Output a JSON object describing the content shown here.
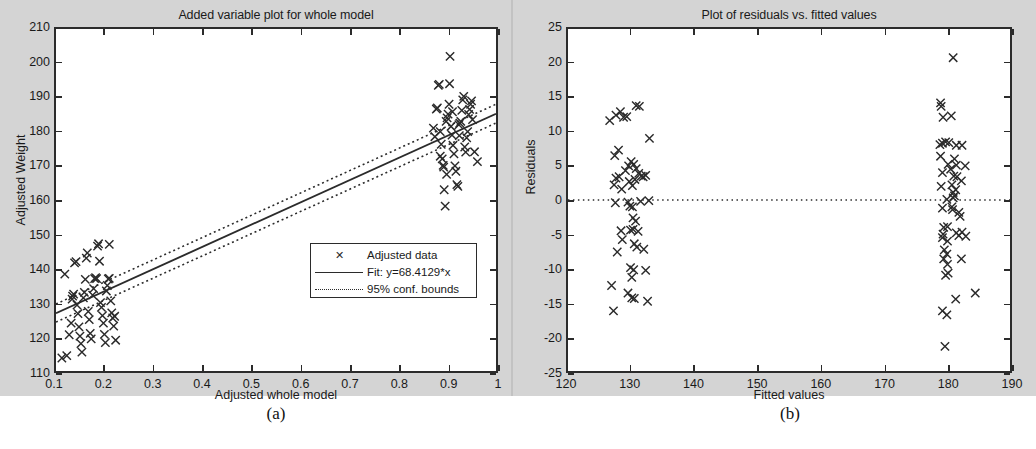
{
  "figure": {
    "background_color": "#d4d4d4",
    "plot_area_color": "#ffffff",
    "axis_color": "#2b2b2b",
    "marker_color": "#2b2b2b",
    "captions": [
      {
        "id": "a",
        "label": "(a)"
      },
      {
        "id": "b",
        "label": "(b)"
      }
    ]
  },
  "chart_data": [
    {
      "type": "scatter",
      "panel": "a",
      "title": "Added variable plot for whole model",
      "xlabel": "Adjusted whole model",
      "ylabel": "Adjusted Weight",
      "xlim": [
        0.1,
        1
      ],
      "ylim": [
        110,
        210
      ],
      "xticks": [
        0.1,
        0.2,
        0.3,
        0.4,
        0.5,
        0.6,
        0.7,
        0.8,
        0.9,
        1
      ],
      "xticklabels": [
        "0.1",
        "0.2",
        "0.3",
        "0.4",
        "0.5",
        "0.6",
        "0.7",
        "0.8",
        "0.9",
        "1"
      ],
      "yticks": [
        110,
        120,
        130,
        140,
        150,
        160,
        170,
        180,
        190,
        200,
        210
      ],
      "yticklabels": [
        "110",
        "120",
        "130",
        "140",
        "150",
        "160",
        "170",
        "180",
        "190",
        "200",
        "210"
      ],
      "grid": false,
      "legend_position": "center-right",
      "legend": [
        {
          "marker": "x",
          "style": "marker",
          "label": "Adjusted data"
        },
        {
          "marker": "line",
          "style": "solid",
          "label": "Fit: y=68.4129*x"
        },
        {
          "marker": "line",
          "style": "dotted",
          "label": "95% conf. bounds"
        }
      ],
      "fit_line": {
        "equation": "y=68.4129*x",
        "slope": 68.4129,
        "x": [
          0.1,
          1.0
        ],
        "y": [
          126.9,
          185.2
        ]
      },
      "conf_bounds": {
        "label": "95% conf. bounds",
        "upper": {
          "x": [
            0.1,
            1.0
          ],
          "y": [
            129.6,
            188.0
          ]
        },
        "lower": {
          "x": [
            0.1,
            1.0
          ],
          "y": [
            124.3,
            182.5
          ]
        }
      },
      "series": [
        {
          "name": "Adjusted data",
          "marker": "x",
          "points": [
            [
              0.118,
              138.3
            ],
            [
              0.112,
              113.8
            ],
            [
              0.122,
              114.5
            ],
            [
              0.127,
              120.6
            ],
            [
              0.131,
              124.0
            ],
            [
              0.133,
              131.0
            ],
            [
              0.134,
              131.9
            ],
            [
              0.136,
              132.5
            ],
            [
              0.138,
              141.6
            ],
            [
              0.141,
              142.0
            ],
            [
              0.143,
              129.3
            ],
            [
              0.145,
              126.8
            ],
            [
              0.147,
              122.9
            ],
            [
              0.149,
              120.2
            ],
            [
              0.151,
              118.0
            ],
            [
              0.153,
              115.5
            ],
            [
              0.156,
              131.4
            ],
            [
              0.158,
              133.0
            ],
            [
              0.16,
              136.8
            ],
            [
              0.162,
              143.0
            ],
            [
              0.164,
              144.5
            ],
            [
              0.166,
              127.4
            ],
            [
              0.168,
              125.0
            ],
            [
              0.17,
              121.0
            ],
            [
              0.172,
              119.4
            ],
            [
              0.175,
              132.2
            ],
            [
              0.177,
              134.1
            ],
            [
              0.179,
              137.0
            ],
            [
              0.181,
              137.3
            ],
            [
              0.183,
              137.0
            ],
            [
              0.185,
              146.5
            ],
            [
              0.187,
              147.2
            ],
            [
              0.189,
              142.1
            ],
            [
              0.191,
              130.0
            ],
            [
              0.193,
              128.6
            ],
            [
              0.195,
              126.2
            ],
            [
              0.197,
              124.0
            ],
            [
              0.199,
              120.7
            ],
            [
              0.201,
              118.3
            ],
            [
              0.203,
              133.4
            ],
            [
              0.205,
              135.0
            ],
            [
              0.207,
              136.9
            ],
            [
              0.209,
              137.1
            ],
            [
              0.212,
              130.5
            ],
            [
              0.214,
              127.0
            ],
            [
              0.216,
              125.5
            ],
            [
              0.218,
              123.1
            ],
            [
              0.22,
              126.0
            ],
            [
              0.222,
              119.0
            ],
            [
              0.209,
              147.0
            ],
            [
              0.872,
              181.0
            ],
            [
              0.875,
              178.5
            ],
            [
              0.878,
              186.6
            ],
            [
              0.88,
              186.9
            ],
            [
              0.882,
              193.5
            ],
            [
              0.884,
              193.8
            ],
            [
              0.886,
              180.0
            ],
            [
              0.888,
              176.3
            ],
            [
              0.89,
              172.0
            ],
            [
              0.892,
              170.1
            ],
            [
              0.894,
              163.0
            ],
            [
              0.896,
              158.2
            ],
            [
              0.898,
              183.0
            ],
            [
              0.9,
              184.0
            ],
            [
              0.902,
              185.1
            ],
            [
              0.904,
              188.0
            ],
            [
              0.905,
              194.0
            ],
            [
              0.906,
              202.0
            ],
            [
              0.908,
              181.5
            ],
            [
              0.91,
              179.0
            ],
            [
              0.912,
              176.0
            ],
            [
              0.914,
              173.5
            ],
            [
              0.916,
              170.0
            ],
            [
              0.918,
              168.4
            ],
            [
              0.92,
              164.5
            ],
            [
              0.922,
              164.0
            ],
            [
              0.924,
              182.0
            ],
            [
              0.926,
              182.5
            ],
            [
              0.928,
              183.0
            ],
            [
              0.93,
              186.2
            ],
            [
              0.932,
              189.3
            ],
            [
              0.934,
              190.3
            ],
            [
              0.936,
              175.5
            ],
            [
              0.938,
              174.0
            ],
            [
              0.94,
              178.2
            ],
            [
              0.942,
              180.0
            ],
            [
              0.944,
              185.0
            ],
            [
              0.946,
              186.5
            ],
            [
              0.948,
              188.0
            ],
            [
              0.95,
              189.0
            ],
            [
              0.952,
              183.5
            ],
            [
              0.956,
              174.1
            ],
            [
              0.962,
              171.2
            ],
            [
              0.886,
              172.8
            ],
            [
              0.893,
              169.6
            ],
            [
              0.899,
              167.5
            ],
            [
              0.911,
              185.8
            ],
            [
              0.925,
              178.8
            ]
          ]
        }
      ]
    },
    {
      "type": "scatter",
      "panel": "b",
      "title": "Plot of residuals vs. fitted values",
      "xlabel": "Fitted values",
      "ylabel": "Residuals",
      "xlim": [
        120,
        190
      ],
      "ylim": [
        -25,
        25
      ],
      "xticks": [
        120,
        130,
        140,
        150,
        160,
        170,
        180,
        190
      ],
      "xticklabels": [
        "120",
        "130",
        "140",
        "150",
        "160",
        "170",
        "180",
        "190"
      ],
      "yticks": [
        -25,
        -20,
        -15,
        -10,
        -5,
        0,
        5,
        10,
        15,
        20,
        25
      ],
      "yticklabels": [
        "-25",
        "-20",
        "-15",
        "-10",
        "-5",
        "0",
        "5",
        "10",
        "15",
        "20",
        "25"
      ],
      "grid": false,
      "zero_reference_line": {
        "y": 0,
        "style": "dotted"
      },
      "legend": [],
      "series": [
        {
          "name": "Residuals",
          "marker": "x",
          "points": [
            [
              126.6,
              11.6
            ],
            [
              127.6,
              12.4
            ],
            [
              128.3,
              12.9
            ],
            [
              128.8,
              12.1
            ],
            [
              129.3,
              12.2
            ],
            [
              130.8,
              13.8
            ],
            [
              131.3,
              13.7
            ],
            [
              132.9,
              9.0
            ],
            [
              127.4,
              6.5
            ],
            [
              128.0,
              7.3
            ],
            [
              127.6,
              3.2
            ],
            [
              128.1,
              3.4
            ],
            [
              127.3,
              2.2
            ],
            [
              128.5,
              1.6
            ],
            [
              129.1,
              4.3
            ],
            [
              129.6,
              5.0
            ],
            [
              130.0,
              5.6
            ],
            [
              130.4,
              5.2
            ],
            [
              130.8,
              4.6
            ],
            [
              131.2,
              3.9
            ],
            [
              131.6,
              3.5
            ],
            [
              129.7,
              2.7
            ],
            [
              130.2,
              2.1
            ],
            [
              130.6,
              3.0
            ],
            [
              131.9,
              3.4
            ],
            [
              132.3,
              3.6
            ],
            [
              127.5,
              -0.4
            ],
            [
              129.5,
              -0.3
            ],
            [
              129.8,
              -0.9
            ],
            [
              130.2,
              -1.0
            ],
            [
              131.5,
              -0.2
            ],
            [
              132.8,
              -0.1
            ],
            [
              130.3,
              -2.6
            ],
            [
              130.7,
              -3.1
            ],
            [
              128.4,
              -4.5
            ],
            [
              129.9,
              -4.4
            ],
            [
              130.3,
              -4.3
            ],
            [
              131.1,
              -4.6
            ],
            [
              128.6,
              -5.8
            ],
            [
              130.5,
              -6.4
            ],
            [
              130.9,
              -6.9
            ],
            [
              132.0,
              -7.2
            ],
            [
              127.8,
              -7.6
            ],
            [
              129.9,
              -9.9
            ],
            [
              130.4,
              -10.2
            ],
            [
              132.3,
              -10.3
            ],
            [
              130.1,
              -11.3
            ],
            [
              126.9,
              -12.5
            ],
            [
              129.5,
              -13.6
            ],
            [
              130.1,
              -14.3
            ],
            [
              130.5,
              -14.4
            ],
            [
              132.6,
              -14.8
            ],
            [
              127.2,
              -16.2
            ],
            [
              179.0,
              14.2
            ],
            [
              179.1,
              13.7
            ],
            [
              179.4,
              12.1
            ],
            [
              180.7,
              12.3
            ],
            [
              178.9,
              8.1
            ],
            [
              179.3,
              8.3
            ],
            [
              179.8,
              8.5
            ],
            [
              180.3,
              8.4
            ],
            [
              181.5,
              8.0
            ],
            [
              182.4,
              8.0
            ],
            [
              179.0,
              6.4
            ],
            [
              181.2,
              6.0
            ],
            [
              180.2,
              5.2
            ],
            [
              181.5,
              5.1
            ],
            [
              182.9,
              5.0
            ],
            [
              179.3,
              4.0
            ],
            [
              180.6,
              4.5
            ],
            [
              181.1,
              3.5
            ],
            [
              181.6,
              3.4
            ],
            [
              182.3,
              2.8
            ],
            [
              179.1,
              2.0
            ],
            [
              180.8,
              2.2
            ],
            [
              181.4,
              1.5
            ],
            [
              181.0,
              1.1
            ],
            [
              181.2,
              0.6
            ],
            [
              180.0,
              0.1
            ],
            [
              181.0,
              0.3
            ],
            [
              179.3,
              -1.2
            ],
            [
              180.8,
              -1.0
            ],
            [
              180.9,
              -1.4
            ],
            [
              181.9,
              -1.8
            ],
            [
              182.1,
              -2.4
            ],
            [
              179.5,
              -4.0
            ],
            [
              180.1,
              -3.9
            ],
            [
              179.4,
              -5.0
            ],
            [
              181.5,
              -4.8
            ],
            [
              182.4,
              -4.7
            ],
            [
              183.0,
              -5.3
            ],
            [
              179.3,
              -5.5
            ],
            [
              180.1,
              -6.0
            ],
            [
              181.9,
              -5.2
            ],
            [
              179.6,
              -7.3
            ],
            [
              180.0,
              -7.9
            ],
            [
              179.5,
              -8.6
            ],
            [
              182.3,
              -8.6
            ],
            [
              180.1,
              -9.4
            ],
            [
              180.2,
              -10.7
            ],
            [
              179.8,
              -11.0
            ],
            [
              181.4,
              -14.5
            ],
            [
              184.5,
              -13.6
            ],
            [
              179.3,
              -16.2
            ],
            [
              180.0,
              -16.8
            ],
            [
              179.7,
              -21.4
            ],
            [
              181.0,
              20.8
            ]
          ]
        }
      ]
    }
  ]
}
